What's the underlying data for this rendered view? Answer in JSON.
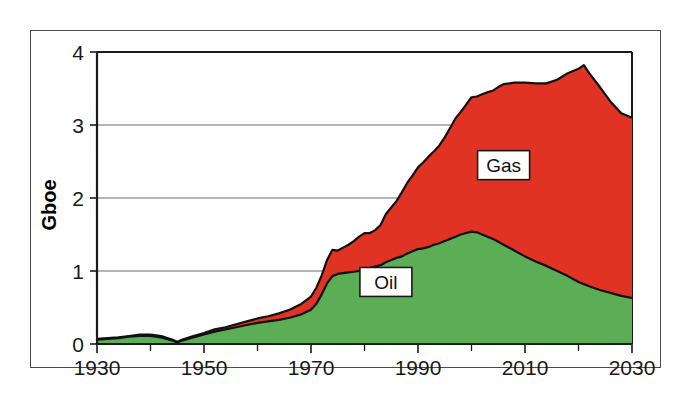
{
  "chart_data": {
    "type": "area",
    "stacked": true,
    "title": "",
    "subtitle": "",
    "xlabel": "",
    "ylabel": "Gboe",
    "xlim": [
      1930,
      2030
    ],
    "ylim": [
      0,
      4
    ],
    "grid": true,
    "grid_axis": "y",
    "legend_position": "inline-annotations",
    "x_ticks": [
      1930,
      1950,
      1970,
      1990,
      2010,
      2030
    ],
    "x_tick_labels": [
      "1930",
      "1950",
      "1970",
      "1990",
      "2010",
      "2030"
    ],
    "x_minor_ticks": [
      1940,
      1960,
      1980,
      2000,
      2020
    ],
    "y_ticks": [
      0,
      1,
      2,
      3,
      4
    ],
    "y_tick_labels": [
      "0",
      "1",
      "2",
      "3",
      "4"
    ],
    "colors": {
      "oil": "#5CAE56",
      "gas": "#E03323",
      "outline": "#111111",
      "axis": "#1a1a1a",
      "grid": "#6f6f6f",
      "background": "#ffffff",
      "frame": "#4a4a4a"
    },
    "annotations": [
      {
        "label": "Gas",
        "x": 2006,
        "y": 2.45
      },
      {
        "label": "Oil",
        "x": 1984,
        "y": 0.85
      }
    ],
    "x": [
      1930,
      1932,
      1934,
      1936,
      1938,
      1940,
      1942,
      1944,
      1945,
      1946,
      1948,
      1950,
      1952,
      1954,
      1956,
      1958,
      1960,
      1962,
      1964,
      1966,
      1968,
      1970,
      1971,
      1972,
      1973,
      1974,
      1975,
      1976,
      1977,
      1978,
      1979,
      1980,
      1981,
      1982,
      1983,
      1984,
      1985,
      1986,
      1987,
      1988,
      1989,
      1990,
      1991,
      1992,
      1993,
      1994,
      1995,
      1996,
      1997,
      1998,
      1999,
      2000,
      2001,
      2002,
      2003,
      2004,
      2005,
      2006,
      2008,
      2010,
      2012,
      2014,
      2016,
      2018,
      2020,
      2021,
      2022,
      2024,
      2026,
      2028,
      2030
    ],
    "series": [
      {
        "name": "Oil",
        "color": "#5CAE56",
        "values": [
          0.06,
          0.07,
          0.08,
          0.1,
          0.11,
          0.11,
          0.09,
          0.05,
          0.02,
          0.05,
          0.09,
          0.13,
          0.17,
          0.2,
          0.23,
          0.26,
          0.29,
          0.31,
          0.33,
          0.36,
          0.4,
          0.47,
          0.55,
          0.68,
          0.83,
          0.93,
          0.96,
          0.97,
          0.98,
          0.99,
          1.0,
          1.02,
          1.04,
          1.06,
          1.08,
          1.12,
          1.15,
          1.18,
          1.2,
          1.24,
          1.27,
          1.3,
          1.31,
          1.33,
          1.36,
          1.38,
          1.41,
          1.44,
          1.47,
          1.5,
          1.52,
          1.54,
          1.53,
          1.5,
          1.47,
          1.44,
          1.4,
          1.36,
          1.28,
          1.2,
          1.13,
          1.07,
          1.0,
          0.93,
          0.85,
          0.82,
          0.79,
          0.74,
          0.7,
          0.66,
          0.63
        ]
      },
      {
        "name": "Gas",
        "color": "#E03323",
        "values": [
          0.01,
          0.01,
          0.01,
          0.01,
          0.02,
          0.02,
          0.02,
          0.01,
          0.01,
          0.01,
          0.02,
          0.02,
          0.03,
          0.03,
          0.04,
          0.05,
          0.06,
          0.07,
          0.09,
          0.11,
          0.14,
          0.18,
          0.22,
          0.26,
          0.32,
          0.36,
          0.32,
          0.35,
          0.38,
          0.42,
          0.47,
          0.5,
          0.48,
          0.5,
          0.55,
          0.66,
          0.72,
          0.78,
          0.88,
          0.97,
          1.04,
          1.12,
          1.18,
          1.24,
          1.28,
          1.34,
          1.42,
          1.52,
          1.62,
          1.68,
          1.76,
          1.84,
          1.86,
          1.92,
          1.98,
          2.03,
          2.12,
          2.2,
          2.3,
          2.38,
          2.44,
          2.5,
          2.62,
          2.78,
          2.92,
          3.0,
          2.92,
          2.78,
          2.62,
          2.5,
          2.47
        ]
      }
    ],
    "total_label": "Total (Oil + Gas)",
    "units": "Gboe"
  }
}
